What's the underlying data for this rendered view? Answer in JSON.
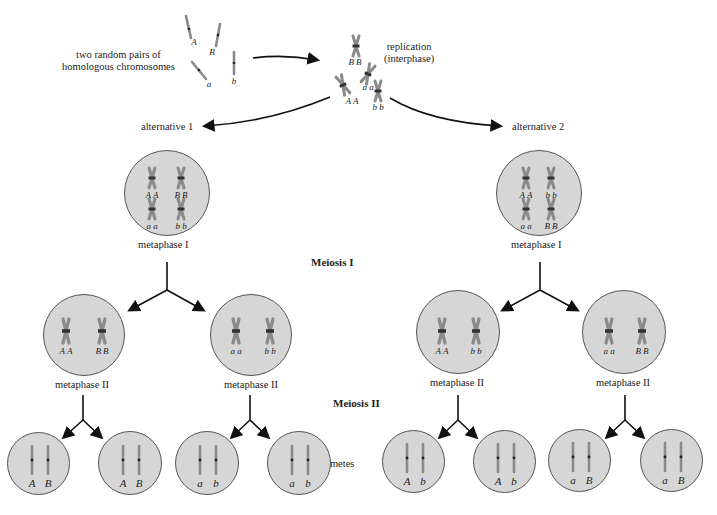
{
  "labels": {
    "intro": [
      "two random pairs of",
      "homologous chromosomes"
    ],
    "replication": [
      "replication",
      "(interphase)"
    ],
    "alt1": "alternative 1",
    "alt2": "alternative 2",
    "metaphase1": "metaphase I",
    "metaphase2": "metaphase II",
    "meiosis1": "Meiosis I",
    "meiosis2": "Meiosis II",
    "gametes": "gametes"
  },
  "start_chromosomes": [
    "A",
    "B",
    "a",
    "b"
  ],
  "replicated": [
    "B B",
    "a a",
    "A A",
    "b b"
  ],
  "alternative1": {
    "metaphase1": [
      "A A",
      "B B",
      "a a",
      "b b"
    ],
    "metaphase2": [
      [
        "A A",
        "B B"
      ],
      [
        "a a",
        "b b"
      ]
    ],
    "gametes": [
      [
        "A",
        "B"
      ],
      [
        "A",
        "B"
      ],
      [
        "a",
        "b"
      ],
      [
        "a",
        "b"
      ]
    ]
  },
  "alternative2": {
    "metaphase1": [
      "A A",
      "b b",
      "a a",
      "B B"
    ],
    "metaphase2": [
      [
        "A A",
        "b b"
      ],
      [
        "a a",
        "B B"
      ]
    ],
    "gametes": [
      [
        "A",
        "b"
      ],
      [
        "A",
        "b"
      ],
      [
        "a",
        "B"
      ],
      [
        "a",
        "B"
      ]
    ]
  },
  "colors": {
    "cell_fill": "#d6d6d6",
    "cell_border": "#555555",
    "chromosome": "#8a8a8a",
    "centromere": "#333333",
    "arrow": "#111111"
  }
}
